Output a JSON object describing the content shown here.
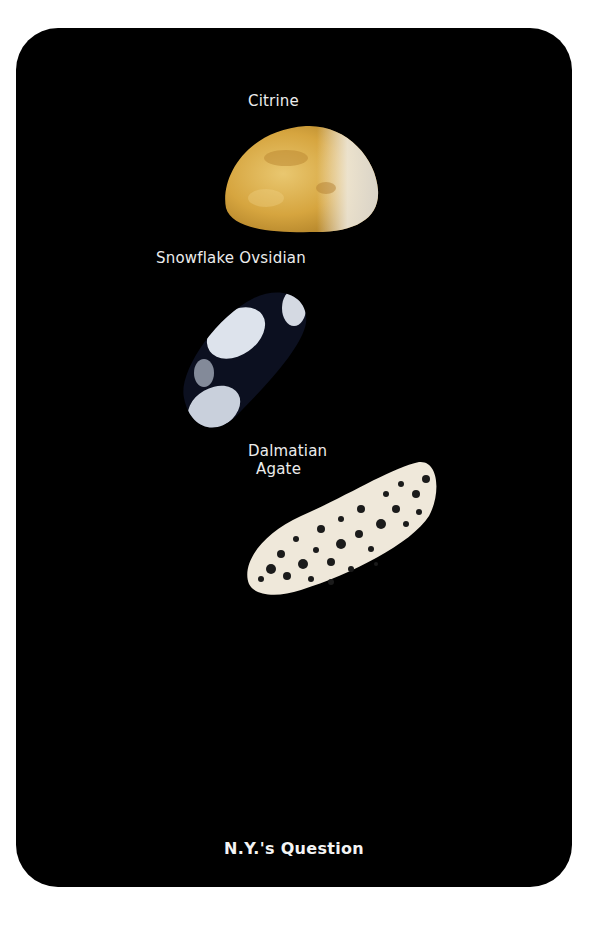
{
  "card": {
    "background": "#000000",
    "page_background": "#ffffff",
    "footer_title": "N.Y.'s Question"
  },
  "stones": [
    {
      "name": "Citrine",
      "icon": "citrine-stone",
      "colors": [
        "#d9a93e",
        "#e8c874",
        "#f2f0ea"
      ]
    },
    {
      "name": "Snowflake Ovsidian",
      "icon": "snowflake-obsidian-stone",
      "colors": [
        "#0d1220",
        "#dfe4ec"
      ]
    },
    {
      "name_line1": "Dalmatian",
      "name_line2": "Agate",
      "icon": "dalmatian-agate-stone",
      "colors": [
        "#efe8da",
        "#1a1a1a"
      ]
    }
  ]
}
